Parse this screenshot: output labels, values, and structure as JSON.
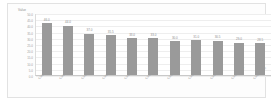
{
  "chart_data": {
    "type": "bar",
    "title": "",
    "xlabel": "",
    "ylabel": "Value",
    "y_axis_title": "Value",
    "grid": true,
    "legend": "none",
    "orientation": "vertical",
    "bar_color": "#9a9a9a",
    "plot_background": "#ffffff",
    "frame_color": "#e2e2e2",
    "label_color": "#9b9b9b",
    "ylim": [
      0,
      50
    ],
    "ytick_labels": [
      "50.0",
      "45.0",
      "40.0",
      "35.0",
      "30.0",
      "25.0",
      "20.0",
      "15.0",
      "10.0",
      "5.0",
      "0.0"
    ],
    "categories": [
      "Category 1",
      "Category 2",
      "Category 3",
      "Category 4",
      "Category 5",
      "Category 6",
      "Category 7",
      "Category 8",
      "Category 9",
      "Category 10",
      "Category 11"
    ],
    "values": [
      46.0,
      44.0,
      37.0,
      35.5,
      33.0,
      33.0,
      30.0,
      31.0,
      30.5,
      29.0,
      28.5
    ],
    "value_labels": [
      "46.0",
      "44.0",
      "37.0",
      "35.5",
      "33.0",
      "33.0",
      "30.0",
      "31.0",
      "30.5",
      "29.0",
      "28.5"
    ]
  }
}
